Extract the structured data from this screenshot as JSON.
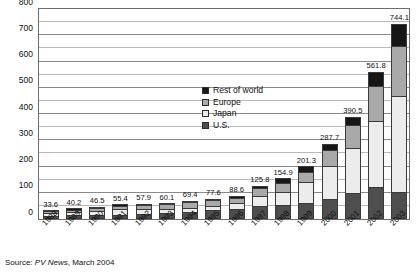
{
  "chart_data": {
    "type": "bar",
    "subtype": "stacked-column",
    "title": "",
    "xlabel": "",
    "ylabel": "",
    "ylim": [
      0,
      800
    ],
    "ytick_step": 100,
    "yminor_step": 50,
    "grid": true,
    "legend_position": "inside-upper-center",
    "categories": [
      "1988",
      "1989",
      "1990",
      "1991",
      "1992",
      "1993",
      "1994",
      "1995",
      "1996",
      "1997",
      "1998",
      "1999",
      "2000",
      "2001",
      "2002",
      "2003"
    ],
    "ytick_labels": [
      "0",
      "100",
      "200",
      "300",
      "400",
      "500",
      "600",
      "700",
      "800"
    ],
    "series": [
      {
        "name": "U.S.",
        "color": "#4e4e4e",
        "values": [
          11.1,
          14.1,
          14.8,
          17.1,
          18.1,
          22.4,
          25.6,
          34.8,
          38.8,
          51.0,
          53.7,
          60.8,
          75.0,
          100.3,
          120.6,
          103.0
        ]
      },
      {
        "name": "Japan",
        "color": "#ececec",
        "values": [
          12.8,
          14.2,
          16.8,
          19.9,
          18.8,
          16.7,
          16.5,
          16.4,
          21.2,
          35.0,
          49.0,
          80.0,
          128.6,
          171.2,
          251.1,
          363.9
        ]
      },
      {
        "name": "Europe",
        "color": "#a9a9a9",
        "values": [
          6.7,
          7.9,
          10.2,
          13.4,
          16.4,
          16.6,
          21.7,
          20.1,
          18.8,
          30.4,
          33.5,
          40.0,
          60.7,
          86.4,
          135.1,
          193.4
        ]
      },
      {
        "name": "Rest of world",
        "color": "#161616",
        "values": [
          3.0,
          4.0,
          4.7,
          5.0,
          4.6,
          4.4,
          5.6,
          6.3,
          9.8,
          9.4,
          18.7,
          20.5,
          23.4,
          32.6,
          55.0,
          83.8
        ]
      }
    ],
    "totals": [
      33.6,
      40.2,
      46.5,
      55.4,
      57.9,
      60.1,
      69.4,
      77.6,
      88.6,
      125.8,
      154.9,
      201.3,
      287.7,
      390.5,
      561.8,
      744.1
    ],
    "total_labels": [
      "33.6",
      "40.2",
      "46.5",
      "55.4",
      "57.9",
      "60.1",
      "69.4",
      "77.6",
      "88.6",
      "125.8",
      "154.9",
      "201.3",
      "287.7",
      "390.5",
      "561.8",
      "744.1"
    ]
  },
  "legend": {
    "items": [
      {
        "label": "Rest of world",
        "color": "#161616"
      },
      {
        "label": "Europe",
        "color": "#a9a9a9"
      },
      {
        "label": "Japan",
        "color": "#ececec"
      },
      {
        "label": "U.S.",
        "color": "#4e4e4e"
      }
    ]
  },
  "source": {
    "prefix": "Source: ",
    "publication": "PV News",
    "suffix": ", March 2004"
  }
}
